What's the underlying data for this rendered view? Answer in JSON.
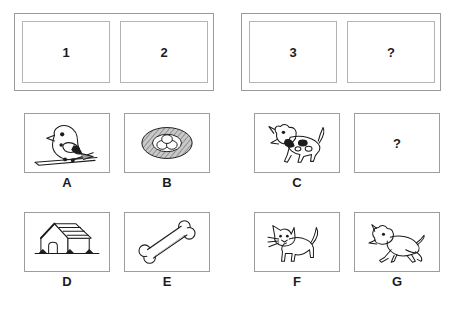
{
  "puzzle": {
    "type": "visual-analogy-matrix",
    "top_row": {
      "left_group": {
        "cells": [
          {
            "label": "1"
          },
          {
            "label": "2"
          }
        ]
      },
      "right_group": {
        "cells": [
          {
            "label": "3"
          },
          {
            "label": "?"
          }
        ]
      }
    },
    "middle_row": {
      "cards": [
        {
          "id": "A",
          "label": "A",
          "icon": "bird-icon",
          "description": "bird perched on branch"
        },
        {
          "id": "B",
          "label": "B",
          "icon": "nest-with-eggs-icon",
          "description": "nest containing three eggs"
        },
        {
          "id": "C",
          "label": "C",
          "icon": "spotted-dog-icon",
          "description": "spotted dog"
        },
        {
          "id": "Q",
          "label": "",
          "icon": "question-mark",
          "description": "unknown answer",
          "text": "?"
        }
      ]
    },
    "bottom_row": {
      "cards": [
        {
          "id": "D",
          "label": "D",
          "icon": "doghouse-icon",
          "description": "dog house with arched door"
        },
        {
          "id": "E",
          "label": "E",
          "icon": "bone-icon",
          "description": "bone"
        },
        {
          "id": "F",
          "label": "F",
          "icon": "cat-icon",
          "description": "standing cat with whiskers"
        },
        {
          "id": "G",
          "label": "G",
          "icon": "running-dog-icon",
          "description": "running dog"
        }
      ]
    }
  },
  "colors": {
    "background": "#ffffff",
    "frame_stroke": "#9a9a9a",
    "cell_stroke": "#b4b4b4",
    "card_stroke": "#9d9d9d",
    "ink": "#1c1c1c",
    "nest_fill": "#a8a8a8"
  }
}
